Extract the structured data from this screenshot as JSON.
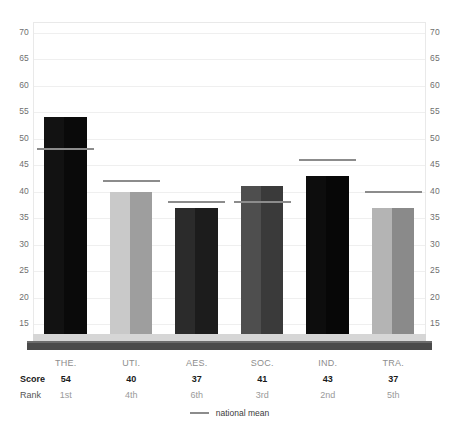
{
  "chart_data": {
    "type": "bar",
    "title": "",
    "subtitle": "",
    "xlabel": "",
    "ylabel": "",
    "ylim": [
      12,
      72
    ],
    "grid": true,
    "legend_position": "bottom-center",
    "categories": [
      "THE.",
      "UTI.",
      "AES.",
      "SOC.",
      "IND.",
      "TRA."
    ],
    "values": [
      54,
      40,
      37,
      41,
      43,
      37
    ],
    "ranks": [
      "1st",
      "4th",
      "6th",
      "3rd",
      "2nd",
      "5th"
    ],
    "national_mean": [
      48,
      42,
      38,
      38,
      46,
      40
    ],
    "yticks": [
      70,
      65,
      60,
      55,
      50,
      45,
      40,
      35,
      30,
      25,
      20,
      15
    ],
    "series": [
      {
        "name": "Score",
        "values": [
          54,
          40,
          37,
          41,
          43,
          37
        ]
      },
      {
        "name": "national mean",
        "values": [
          48,
          42,
          38,
          38,
          46,
          40
        ]
      }
    ],
    "bar_colors_left": [
      "#121212",
      "#c9c9c9",
      "#2b2b2b",
      "#4e4e4e",
      "#0d0d0d",
      "#b4b4b4"
    ],
    "bar_colors_right": [
      "#0a0a0a",
      "#9e9e9e",
      "#1c1c1c",
      "#3a3a3a",
      "#070707",
      "#8a8a8a"
    ]
  },
  "axis": {
    "left": {
      "ticks": [
        "70",
        "65",
        "60",
        "55",
        "50",
        "45",
        "40",
        "35",
        "30",
        "25",
        "20",
        "15"
      ]
    },
    "right": {
      "ticks": [
        "70",
        "65",
        "60",
        "55",
        "50",
        "45",
        "40",
        "35",
        "30",
        "25",
        "20",
        "15"
      ]
    }
  },
  "table": {
    "row_headers": [
      "",
      "Score",
      "Rank"
    ],
    "categories": [
      "THE.",
      "UTI.",
      "AES.",
      "SOC.",
      "IND.",
      "TRA."
    ],
    "scores": [
      "54",
      "40",
      "37",
      "41",
      "43",
      "37"
    ],
    "ranks": [
      "1st",
      "4th",
      "6th",
      "3rd",
      "2nd",
      "5th"
    ]
  },
  "legend": {
    "label": "national mean",
    "swatch_color": "#8c8c8c"
  },
  "colors": {
    "gridline": "#efefef",
    "frame_border": "#e9e9e9",
    "mean_line": "#8c8c8c",
    "platform_top": "#d6d6d6",
    "platform_face": "#4a4a4a",
    "tick_text": "#6f6f6f",
    "background": "#ffffff"
  }
}
